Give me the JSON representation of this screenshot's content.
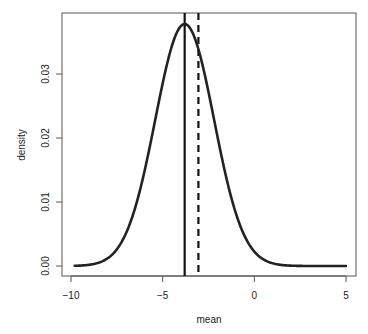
{
  "chart_data": {
    "type": "line",
    "title": "",
    "xlabel": "mean",
    "ylabel": "density",
    "xlim": [
      -10.5,
      5.5
    ],
    "ylim": [
      -0.0015,
      0.0394
    ],
    "grid": false,
    "legend": null,
    "x_ticks": [
      -10,
      -5,
      0,
      5
    ],
    "x_tick_labels": [
      "-10",
      "-5",
      "0",
      "5"
    ],
    "y_ticks": [
      0.0,
      0.01,
      0.02,
      0.03
    ],
    "y_tick_labels": [
      "0.00",
      "0.01",
      "0.02",
      "0.03"
    ],
    "series": [
      {
        "name": "density curve",
        "style": "solid-thick",
        "shape": "gaussian",
        "center": -3.8,
        "sd": 1.6,
        "peak": 0.0378,
        "x_range": [
          -9.8,
          5.0
        ],
        "x": [
          -9.8,
          -9,
          -8,
          -7,
          -6.5,
          -6,
          -5.5,
          -5,
          -4.5,
          -4,
          -3.8,
          -3.5,
          -3,
          -2.5,
          -2,
          -1.5,
          -1,
          -0.5,
          0,
          1,
          2,
          3,
          4,
          5
        ],
        "values": [
          0.0003,
          0.0008,
          0.0024,
          0.0051,
          0.0091,
          0.0146,
          0.0212,
          0.0287,
          0.0351,
          0.0375,
          0.0378,
          0.0372,
          0.0334,
          0.0271,
          0.0199,
          0.0133,
          0.0081,
          0.0044,
          0.0022,
          0.0004,
          0.0,
          0.0,
          0.0,
          0.0
        ]
      }
    ],
    "annotations": [
      {
        "type": "vline",
        "x": -3.8,
        "style": "solid",
        "label": ""
      },
      {
        "type": "vline",
        "x": -3.05,
        "style": "dashed",
        "label": ""
      }
    ]
  }
}
